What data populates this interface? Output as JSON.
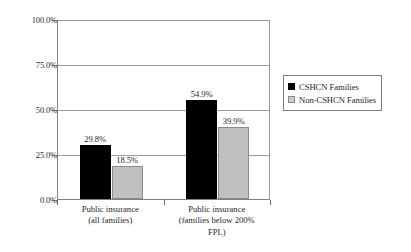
{
  "chart_data": {
    "type": "bar",
    "title": "",
    "xlabel": "",
    "ylabel": "",
    "ylim": [
      0,
      100
    ],
    "grid": true,
    "legend_position": "right",
    "categories": [
      "Public insurance\n(all families)",
      "Public insurance\n(families below 200%\nFPL)"
    ],
    "ytick_labels": [
      "100.0%",
      "75.0%",
      "50.0%",
      "25.0%",
      "0.0%"
    ],
    "ytick_values": [
      100,
      75,
      50,
      25,
      0
    ],
    "series": [
      {
        "name": "CSHCN Families",
        "color": "#000000",
        "values": [
          29.8,
          54.9
        ],
        "data_labels": [
          "29.8%",
          "54.9%"
        ]
      },
      {
        "name": "Non-CSHCN Families",
        "color": "#c0c0c0",
        "values": [
          18.5,
          39.9
        ],
        "data_labels": [
          "18.5%",
          "39.9%"
        ]
      }
    ]
  },
  "legend": {
    "items": [
      {
        "label": "CSHCN Families",
        "swatch": "black-square-icon"
      },
      {
        "label": "Non-CSHCN Families",
        "swatch": "gray-square-icon"
      }
    ]
  }
}
